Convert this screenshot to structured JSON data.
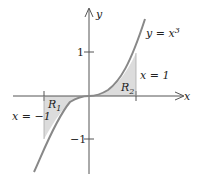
{
  "figure": {
    "curve_label": "y = x³",
    "curve_label_y": "y = x",
    "curve_label_exp": "3",
    "axis_x_label": "x",
    "axis_y_label": "y",
    "tick_y_pos": "1",
    "tick_y_neg": "−1",
    "region_1": "R",
    "region_1_sub": "1",
    "region_2": "R",
    "region_2_sub": "2",
    "line_left": "x = −1",
    "line_right": "x = 1"
  },
  "colors": {
    "curve": "#888888",
    "shade": "#dcdcdc",
    "axis": "#555555"
  }
}
